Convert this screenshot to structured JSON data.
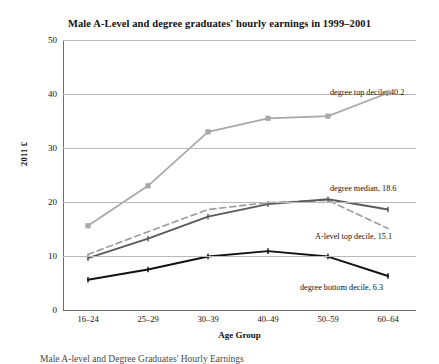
{
  "chart_data": {
    "type": "line",
    "title": "Male A-Level and degree graduates' hourly earnings in 1999–2001",
    "xlabel": "Age Group",
    "ylabel": "2011 £",
    "categories": [
      "16–24",
      "25–29",
      "30–39",
      "40–49",
      "50–59",
      "60–64"
    ],
    "ylim": [
      0,
      50
    ],
    "yticks": [
      0,
      10,
      20,
      30,
      40,
      50
    ],
    "grid": true,
    "legend_position": "inline-annotations",
    "series": [
      {
        "name": "degree top decile",
        "values": [
          15.6,
          23.0,
          33.0,
          35.5,
          35.9,
          40.2
        ],
        "color": "#a8a8a8",
        "style": "solid",
        "marker": "square",
        "end_label": "degree top decile, 40.2"
      },
      {
        "name": "A-level top decile",
        "values": [
          10.3,
          14.5,
          18.6,
          19.9,
          20.3,
          15.1
        ],
        "color": "#9d9d9d",
        "style": "dashed",
        "marker": "none",
        "end_label": "A-level top decile, 15.1"
      },
      {
        "name": "degree median",
        "values": [
          9.6,
          13.2,
          17.3,
          19.6,
          20.5,
          18.6
        ],
        "color": "#5a5a5a",
        "style": "solid",
        "marker": "tick",
        "end_label": "degree median, 18.6"
      },
      {
        "name": "degree bottom decile",
        "values": [
          5.6,
          7.5,
          9.9,
          10.9,
          9.9,
          6.3
        ],
        "color": "#111111",
        "style": "solid",
        "marker": "tick",
        "end_label": "degree bottom decile, 6.3"
      }
    ],
    "annotations": [
      {
        "text": "degree top decile, 40.2",
        "x": 330,
        "y": 88
      },
      {
        "text": "degree median, 18.6",
        "x": 330,
        "y": 184
      },
      {
        "text": "A-level top decile, 15.1",
        "x": 315,
        "y": 232
      },
      {
        "text": "degree bottom decile, 6.3",
        "x": 300,
        "y": 283
      }
    ]
  },
  "caption": {
    "text": "Male A-level and Degree Graduates' Hourly Earnings"
  }
}
